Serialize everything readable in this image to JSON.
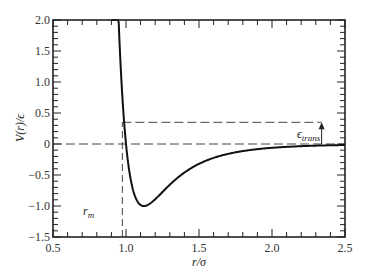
{
  "chart_data": {
    "type": "line",
    "title": "",
    "xlabel": "r/σ",
    "ylabel": "V(r)/ϵ",
    "xlim": [
      0.5,
      2.5
    ],
    "ylim": [
      -1.5,
      2.0
    ],
    "x_ticks": [
      "0.5",
      "1.0",
      "1.5",
      "2.0",
      "2.5"
    ],
    "y_ticks": [
      "2.0",
      "1.5",
      "1.0",
      "0.5",
      "0",
      "-0.5",
      "-1.0",
      "-1.5"
    ],
    "grid": false,
    "legend": null,
    "series": [
      {
        "name": "Lennard-Jones potential",
        "description": "V(r)/ϵ = 4[(σ/r)^12 - (σ/r)^6], minimum -1.0 at r/σ ≈ 1.12",
        "x": [
          0.9,
          0.92,
          0.94,
          0.96,
          0.98,
          1.0,
          1.02,
          1.05,
          1.08,
          1.12,
          1.16,
          1.2,
          1.3,
          1.4,
          1.5,
          1.6,
          1.8,
          2.0,
          2.2,
          2.5
        ],
        "values": [
          2.0,
          1.35,
          0.85,
          0.49,
          0.22,
          0.0,
          -0.18,
          -0.47,
          -0.72,
          -1.0,
          -0.95,
          -0.89,
          -0.72,
          -0.54,
          -0.32,
          -0.23,
          -0.12,
          -0.06,
          -0.03,
          -0.01
        ]
      }
    ],
    "annotations": [
      {
        "type": "hline-dashed",
        "y": 0,
        "label": ""
      },
      {
        "type": "hline-dashed",
        "y": 0.35,
        "x_from": 0.975,
        "x_to": 2.34,
        "label": ""
      },
      {
        "type": "vline-dashed",
        "x": 0.975,
        "y_from": -1.5,
        "y_to": 0.35,
        "label": "r_m"
      },
      {
        "type": "arrow",
        "x": 2.34,
        "y_from": 0,
        "y_to": 0.35,
        "label": "ϵ_trans"
      }
    ]
  },
  "labels": {
    "ylabel_main": "V(r)/ϵ",
    "xlabel_main": "r/σ",
    "rm_main": "r",
    "rm_sub": "m",
    "etrans_main": "ϵ",
    "etrans_sub": "trans"
  }
}
